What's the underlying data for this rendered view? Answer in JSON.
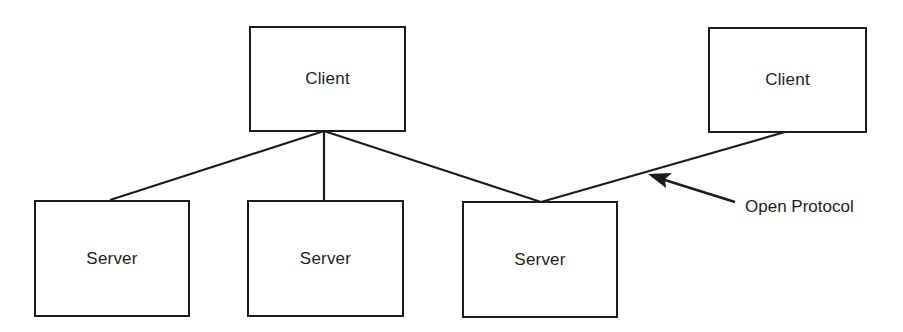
{
  "diagram": {
    "title": "",
    "nodes": [
      {
        "id": "client-1",
        "label": "Client",
        "type": "client"
      },
      {
        "id": "client-2",
        "label": "Client",
        "type": "client"
      },
      {
        "id": "server-1",
        "label": "Server",
        "type": "server"
      },
      {
        "id": "server-2",
        "label": "Server",
        "type": "server"
      },
      {
        "id": "server-3",
        "label": "Server",
        "type": "server"
      }
    ],
    "edges": [
      {
        "from": "client-1",
        "to": "server-1"
      },
      {
        "from": "client-1",
        "to": "server-2"
      },
      {
        "from": "client-1",
        "to": "server-3"
      },
      {
        "from": "client-2",
        "to": "server-3"
      }
    ],
    "annotations": [
      {
        "text": "Open Protocol",
        "points_to": "client-2 to server-3 edge"
      }
    ]
  }
}
